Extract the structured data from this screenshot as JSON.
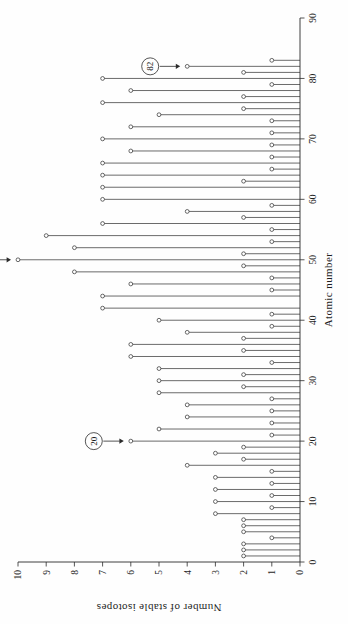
{
  "figure": {
    "orientation": "rotated-90-ccw",
    "background_color": "#fefefe",
    "ink_color": "#2b2b2b"
  },
  "chart_data": {
    "type": "bar",
    "title": "",
    "subtitle": "",
    "xlabel": "Atomic number",
    "ylabel": "Number of stable isotopes",
    "xlim": [
      0,
      90
    ],
    "ylim": [
      0,
      10
    ],
    "grid": false,
    "legend": null,
    "legend_position": "none",
    "marker": "open-circle",
    "xticks": [
      0,
      10,
      20,
      30,
      40,
      50,
      60,
      70,
      80,
      90
    ],
    "xtick_labels": [
      "0",
      "10",
      "20",
      "30",
      "40",
      "50",
      "60",
      "70",
      "80",
      "90"
    ],
    "yticks": [
      0,
      1,
      2,
      3,
      4,
      5,
      6,
      7,
      8,
      9,
      10
    ],
    "ytick_labels": [
      "0",
      "1",
      "2",
      "3",
      "4",
      "5",
      "6",
      "7",
      "8",
      "9",
      "10"
    ],
    "categories": [
      1,
      2,
      3,
      4,
      5,
      6,
      7,
      8,
      9,
      10,
      11,
      12,
      13,
      14,
      15,
      16,
      17,
      18,
      19,
      20,
      21,
      22,
      23,
      24,
      25,
      26,
      27,
      28,
      29,
      30,
      31,
      32,
      33,
      34,
      35,
      36,
      37,
      38,
      39,
      40,
      41,
      42,
      44,
      45,
      46,
      47,
      48,
      49,
      50,
      51,
      52,
      53,
      54,
      55,
      56,
      57,
      58,
      59,
      60,
      62,
      63,
      64,
      65,
      66,
      67,
      68,
      69,
      70,
      71,
      72,
      73,
      74,
      75,
      76,
      77,
      78,
      79,
      80,
      81,
      82,
      83
    ],
    "values": [
      2,
      2,
      2,
      1,
      2,
      2,
      2,
      3,
      1,
      3,
      1,
      3,
      1,
      3,
      1,
      4,
      2,
      3,
      2,
      6,
      1,
      5,
      1,
      4,
      1,
      4,
      1,
      5,
      2,
      5,
      2,
      5,
      1,
      6,
      2,
      6,
      2,
      4,
      1,
      5,
      1,
      7,
      7,
      1,
      6,
      1,
      8,
      2,
      10,
      2,
      8,
      1,
      9,
      1,
      7,
      2,
      4,
      1,
      7,
      7,
      2,
      7,
      1,
      7,
      1,
      6,
      1,
      7,
      1,
      6,
      1,
      5,
      2,
      7,
      2,
      6,
      1,
      7,
      2,
      4,
      1
    ],
    "annotations": [
      {
        "label": "20",
        "points_to_atomic_number": 20,
        "value": 6,
        "style": "circled-with-arrow"
      },
      {
        "label": "50",
        "points_to_atomic_number": 50,
        "value": 10,
        "style": "circled-with-arrow"
      },
      {
        "label": "82",
        "points_to_atomic_number": 82,
        "value": 4,
        "style": "circled-with-arrow"
      }
    ]
  }
}
